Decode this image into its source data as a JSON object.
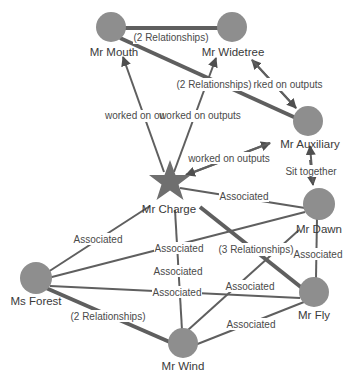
{
  "graph": {
    "nodes": [
      {
        "id": "mouth",
        "label": "Mr Mouth",
        "shape": "circle"
      },
      {
        "id": "widetree",
        "label": "Mr Widetree",
        "shape": "circle"
      },
      {
        "id": "auxiliary",
        "label": "Mr Auxiliary",
        "shape": "circle"
      },
      {
        "id": "charge",
        "label": "Mr Charge",
        "shape": "star"
      },
      {
        "id": "dawn",
        "label": "Mr Dawn",
        "shape": "circle"
      },
      {
        "id": "forest",
        "label": "Ms Forest",
        "shape": "circle"
      },
      {
        "id": "fly",
        "label": "Mr Fly",
        "shape": "circle"
      },
      {
        "id": "wind",
        "label": "Mr Wind",
        "shape": "circle"
      }
    ],
    "edges": [
      {
        "from": "mouth",
        "to": "widetree",
        "label": "(2 Relationships)"
      },
      {
        "from": "mouth",
        "to": "auxiliary",
        "label": "(2 Relationships)"
      },
      {
        "from": "charge",
        "to": "mouth",
        "label": "worked on ou"
      },
      {
        "from": "charge",
        "to": "widetree",
        "label": "worked on outputs"
      },
      {
        "from": "auxiliary",
        "to": "widetree",
        "label": "rked on outputs"
      },
      {
        "from": "charge",
        "to": "auxiliary",
        "label": "worked on outputs"
      },
      {
        "from": "auxiliary",
        "to": "dawn",
        "label": "Sit together"
      },
      {
        "from": "charge",
        "to": "dawn",
        "label": "Associated"
      },
      {
        "from": "charge",
        "to": "forest",
        "label": "Associated"
      },
      {
        "from": "forest",
        "to": "dawn",
        "label": "Associated"
      },
      {
        "from": "charge",
        "to": "wind",
        "label": "Associated"
      },
      {
        "from": "forest",
        "to": "fly",
        "label": "Associated"
      },
      {
        "from": "charge",
        "to": "fly",
        "label": "(3 Relationships)"
      },
      {
        "from": "dawn",
        "to": "fly",
        "label": "Associated"
      },
      {
        "from": "wind",
        "to": "dawn",
        "label": "Associated"
      },
      {
        "from": "wind",
        "to": "fly",
        "label": "Associated"
      },
      {
        "from": "forest",
        "to": "wind",
        "label": "(2 Relationships)"
      }
    ]
  }
}
